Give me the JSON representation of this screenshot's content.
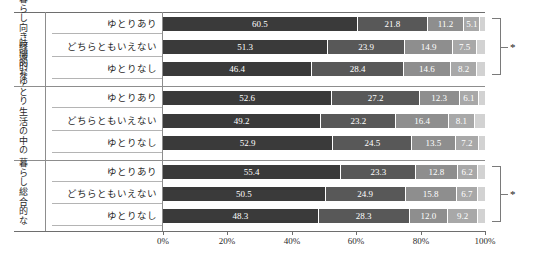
{
  "chart_data": {
    "type": "bar",
    "subtype": "horizontal-stacked-100-percent",
    "title": "",
    "xlabel": "",
    "ylabel": "",
    "xlim": [
      0,
      100
    ],
    "xticks": [
      "0%",
      "20%",
      "40%",
      "60%",
      "80%",
      "100%"
    ],
    "xtick_values": [
      0,
      20,
      40,
      60,
      80,
      100
    ],
    "grid": false,
    "legend_position": "none",
    "series": [
      {
        "name": "segment-1",
        "color": "#3a3a3a"
      },
      {
        "name": "segment-2",
        "color": "#585858"
      },
      {
        "name": "segment-3",
        "color": "#8e8e8e"
      },
      {
        "name": "segment-4",
        "color": "#a8a8a8"
      },
      {
        "name": "segment-5",
        "color": "#d2d2d2"
      }
    ],
    "groups": [
      {
        "label_lines": [
          "経済的な",
          "暮らし向き"
        ],
        "significance": "*",
        "rows": [
          {
            "category": "ゆとりあり",
            "values": [
              60.5,
              21.8,
              11.2,
              5.1,
              1.4
            ]
          },
          {
            "category": "どちらともいえない",
            "values": [
              51.3,
              23.9,
              14.9,
              7.5,
              2.4
            ]
          },
          {
            "category": "ゆとりなし",
            "values": [
              46.4,
              28.4,
              14.6,
              8.2,
              2.4
            ]
          }
        ]
      },
      {
        "label_lines": [
          "生活の中の",
          "時間的なゆとり"
        ],
        "significance": "",
        "rows": [
          {
            "category": "ゆとりあり",
            "values": [
              52.6,
              27.2,
              12.3,
              6.1,
              1.8
            ]
          },
          {
            "category": "どちらともいえない",
            "values": [
              49.2,
              23.2,
              16.4,
              8.1,
              3.1
            ]
          },
          {
            "category": "ゆとりなし",
            "values": [
              52.9,
              24.5,
              13.5,
              7.2,
              1.9
            ]
          }
        ]
      },
      {
        "label_lines": [
          "総合的な",
          "暮らし"
        ],
        "significance": "*",
        "rows": [
          {
            "category": "ゆとりあり",
            "values": [
              55.4,
              23.3,
              12.8,
              6.2,
              2.3
            ]
          },
          {
            "category": "どちらともいえない",
            "values": [
              50.5,
              24.9,
              15.8,
              6.7,
              2.1
            ]
          },
          {
            "category": "ゆとりなし",
            "values": [
              48.3,
              28.3,
              12.0,
              9.2,
              2.2
            ]
          }
        ]
      }
    ],
    "value_label_min_width": 8.0
  }
}
